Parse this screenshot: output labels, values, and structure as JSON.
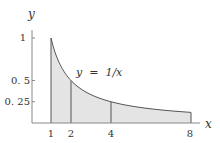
{
  "chart_data": {
    "type": "area",
    "title": "",
    "function": "y = 1/x",
    "xlabel": "x",
    "ylabel": "y",
    "x_ticks": [
      1,
      2,
      4,
      8
    ],
    "x_tick_labels": [
      "1",
      "2",
      "4",
      "8"
    ],
    "y_ticks": [
      1,
      0.5,
      0.25
    ],
    "y_tick_labels": [
      "1",
      "0. 5",
      "0. 25"
    ],
    "xlim": [
      0,
      8.8
    ],
    "ylim": [
      0,
      1.1
    ],
    "grid": false,
    "legend": null,
    "annotations": [
      {
        "text": "y = 1/x",
        "x": 2.3,
        "y": 0.6
      }
    ],
    "shaded_region": {
      "from_x": 1,
      "to_x": 8,
      "under": "y = 1/x"
    },
    "vertical_lines_at_x": [
      1,
      2,
      4,
      8
    ],
    "points": [
      {
        "x": 1,
        "y": 1
      },
      {
        "x": 2,
        "y": 0.5
      },
      {
        "x": 4,
        "y": 0.25
      },
      {
        "x": 8,
        "y": 0.125
      }
    ]
  },
  "labels": {
    "y_axis": "y",
    "x_axis": "x",
    "curve": "y  =  1/x",
    "xt1": "1",
    "xt2": "2",
    "xt4": "4",
    "xt8": "8",
    "yt1": "1",
    "yt05": "0. 5",
    "yt025": "0. 25"
  },
  "colors": {
    "fill": "#e4e4e4",
    "curve": "#555555",
    "axis": "#777777"
  }
}
